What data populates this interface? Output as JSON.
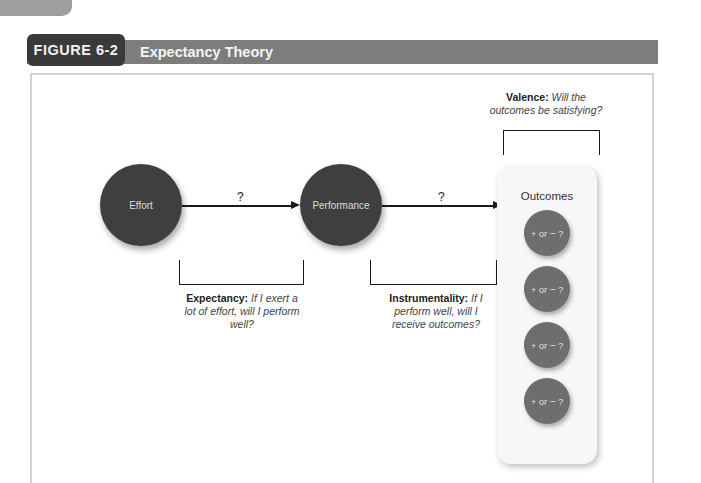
{
  "figure": {
    "label": "FIGURE 6-2",
    "title": "Expectancy Theory"
  },
  "nodes": {
    "effort": "Effort",
    "performance": "Performance"
  },
  "arrows": {
    "effort_to_performance": "?",
    "performance_to_outcomes": "?"
  },
  "outcomes": {
    "title": "Outcomes",
    "items": [
      "+ or − ?",
      "+ or − ?",
      "+ or − ?",
      "+ or − ?"
    ]
  },
  "captions": {
    "expectancy": {
      "term": "Expectancy:",
      "question": "If I exert a lot of effort, will I perform well?"
    },
    "instrumentality": {
      "term": "Instrumentality:",
      "question": "If I perform well, will I receive outcomes?"
    },
    "valence": {
      "term": "Valence:",
      "question": "Will the outcomes be satisfying?"
    }
  },
  "colors": {
    "header_label_bg": "#3a3a3a",
    "header_strip_bg": "#7d7d7d",
    "node_fill": "#3f3f3f",
    "outcome_fill": "#6e6e6e",
    "panel_bg": "#f7f7f7",
    "frame_border": "#d2d2d2"
  }
}
